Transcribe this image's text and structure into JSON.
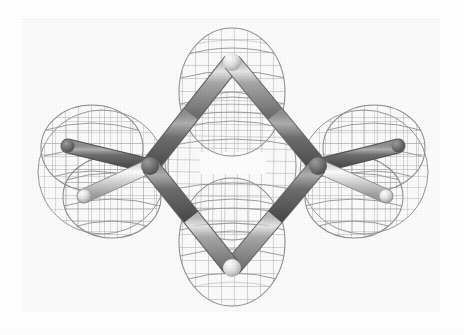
{
  "figure": {
    "render_style": "ball-and-stick with wireframe isosurface mesh",
    "background_color": "#ffffff",
    "panel_color": "#fafafa",
    "caption": ""
  },
  "palette": {
    "mesh_line": "#9a9a9a",
    "mesh_line_dark": "#7d7d7d",
    "bond_mid": "#8e8e8e",
    "bond_dark": "#5f5f5f",
    "bond_light": "#d8d8d8",
    "bond_highlight": "#efefef",
    "hydrogen_light": "#e8e8e8",
    "hydrogen_dark": "#6a6a6a",
    "outline": "#6b6b6b"
  },
  "molecule": {
    "name": "cyclobutadiene",
    "ring_size": 4,
    "ring_orientation": "diamond (vertices at top, right, bottom, left)",
    "atoms": [
      {
        "id": "C1",
        "label": "C",
        "element": "carbon",
        "x": 232,
        "y": 62,
        "role": "ring-top"
      },
      {
        "id": "C2",
        "label": "C",
        "element": "carbon",
        "x": 318,
        "y": 166,
        "role": "ring-right"
      },
      {
        "id": "C3",
        "label": "C",
        "element": "carbon",
        "x": 232,
        "y": 268,
        "role": "ring-bottom"
      },
      {
        "id": "C4",
        "label": "C",
        "element": "carbon",
        "x": 150,
        "y": 166,
        "role": "ring-left"
      },
      {
        "id": "H1",
        "label": "H",
        "element": "hydrogen",
        "x": 74,
        "y": 150,
        "role": "left-upper-substituent"
      },
      {
        "id": "H2",
        "label": "H",
        "element": "hydrogen",
        "x": 88,
        "y": 192,
        "role": "left-lower-substituent"
      },
      {
        "id": "H3",
        "label": "H",
        "element": "hydrogen",
        "x": 392,
        "y": 150,
        "role": "right-upper-substituent"
      },
      {
        "id": "H4",
        "label": "H",
        "element": "hydrogen",
        "x": 382,
        "y": 192,
        "role": "right-lower-substituent"
      }
    ],
    "bonds": [
      {
        "from": "C1",
        "to": "C2",
        "kind": "ring"
      },
      {
        "from": "C2",
        "to": "C3",
        "kind": "ring"
      },
      {
        "from": "C3",
        "to": "C4",
        "kind": "ring"
      },
      {
        "from": "C4",
        "to": "C1",
        "kind": "ring"
      },
      {
        "from": "C4",
        "to": "H1",
        "kind": "c-h"
      },
      {
        "from": "C4",
        "to": "H2",
        "kind": "c-h"
      },
      {
        "from": "C2",
        "to": "H3",
        "kind": "c-h"
      },
      {
        "from": "C2",
        "to": "H4",
        "kind": "c-h"
      }
    ]
  },
  "isosurface": {
    "type": "wireframe mesh",
    "lobes": [
      {
        "id": "lobe-top",
        "center_x": 232,
        "center_y": 92,
        "rx": 52,
        "ry": 62
      },
      {
        "id": "lobe-bottom",
        "center_x": 232,
        "center_y": 242,
        "rx": 52,
        "ry": 62
      },
      {
        "id": "lobe-left-upper",
        "center_x": 92,
        "center_y": 148,
        "rx": 50,
        "ry": 42
      },
      {
        "id": "lobe-left-lower",
        "center_x": 110,
        "center_y": 196,
        "rx": 48,
        "ry": 40
      },
      {
        "id": "lobe-right-upper",
        "center_x": 374,
        "center_y": 148,
        "rx": 50,
        "ry": 42
      },
      {
        "id": "lobe-right-lower",
        "center_x": 356,
        "center_y": 196,
        "rx": 48,
        "ry": 40
      },
      {
        "id": "lobe-center",
        "center_x": 232,
        "center_y": 166,
        "rx": 62,
        "ry": 72
      }
    ],
    "grid_spacing_px": 13,
    "center_void": {
      "x": 200,
      "y": 152,
      "width": 66,
      "height": 22
    }
  }
}
